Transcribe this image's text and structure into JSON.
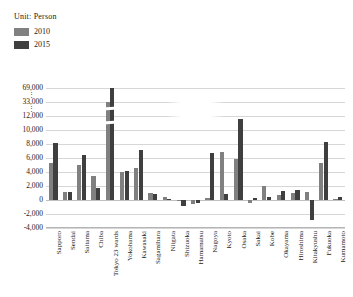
{
  "unit_caption": "Unit: Person",
  "legend": {
    "position": "top-left",
    "items": [
      {
        "label": "2010",
        "color": "#808080"
      },
      {
        "label": "2015",
        "color": "#3f3f3f"
      }
    ]
  },
  "chart_data": {
    "type": "bar",
    "title": "",
    "subtitle": "",
    "xlabel": "",
    "ylabel": "",
    "unit": "Person",
    "grid": true,
    "legend_position": "top-left",
    "axis_note": "broken y-axis: linear 0-12,000 then compressed segments to 33,000 and 69,000",
    "ytick_labels": [
      "-4,000",
      "-2,000",
      "0",
      "2,000",
      "4,000",
      "6,000",
      "8,000",
      "10,000",
      "12,000",
      "33,000",
      "69,000"
    ],
    "ytick_values": [
      -4000,
      -2000,
      0,
      2000,
      4000,
      6000,
      8000,
      10000,
      12000,
      33000,
      69000
    ],
    "ylim": [
      -4000,
      69000
    ],
    "categories": [
      "Sapporo",
      "Sendai",
      "Saitama",
      "Chiba",
      "Tokyo 23 wards",
      "Yokohama",
      "Kawasaki",
      "Sagamihara",
      "Niigata",
      "Shizuoka",
      "Hamamatsu",
      "Nagoya",
      "Kyoto",
      "Osaka",
      "Sakai",
      "Kobe",
      "Okayama",
      "Hiroshima",
      "Kitakyushu",
      "Fukuoka",
      "Kumamoto"
    ],
    "series": [
      {
        "name": "2010",
        "color": "#808080",
        "values": [
          5300,
          1100,
          5000,
          3400,
          33000,
          4000,
          4600,
          1000,
          500,
          -200,
          -500,
          300,
          6800,
          5800,
          -400,
          2000,
          700,
          1000,
          1200,
          5300,
          100
        ]
      },
      {
        "name": "2015",
        "color": "#3f3f3f",
        "values": [
          8100,
          1100,
          6500,
          1700,
          69000,
          4200,
          7100,
          800,
          200,
          -800,
          -400,
          6700,
          900,
          11600,
          300,
          500,
          1300,
          1400,
          -2800,
          8300,
          400
        ]
      }
    ]
  }
}
